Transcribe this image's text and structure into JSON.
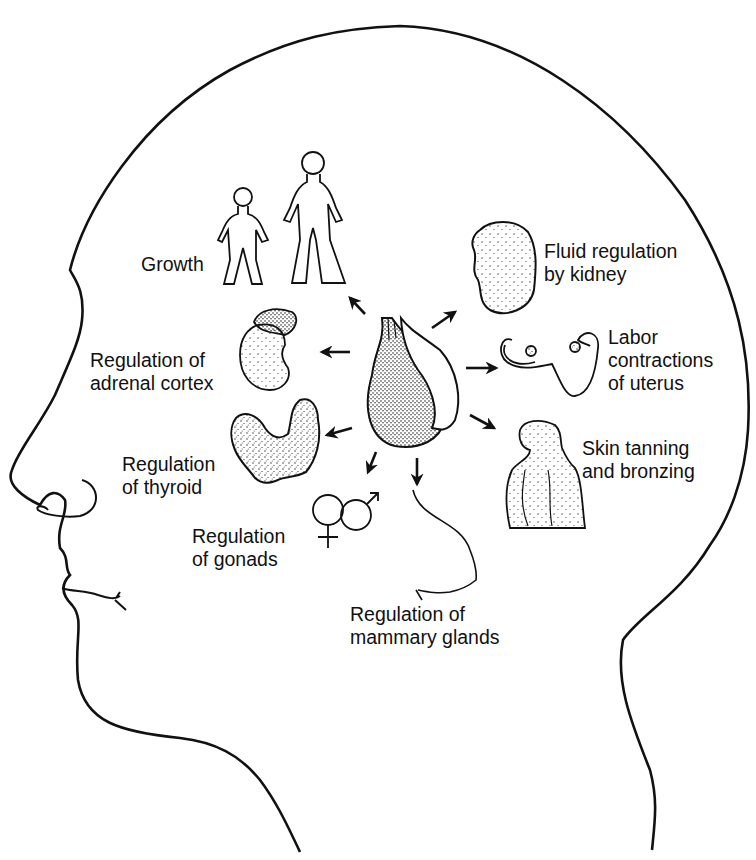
{
  "diagram": {
    "center": "pituitary-gland",
    "colors": {
      "ink": "#111111",
      "background": "#ffffff"
    },
    "labels": [
      {
        "id": "growth",
        "lines": [
          "Growth"
        ]
      },
      {
        "id": "fluid",
        "lines": [
          "Fluid regulation",
          "by kidney"
        ]
      },
      {
        "id": "adrenal",
        "lines": [
          "Regulation of",
          "adrenal cortex"
        ]
      },
      {
        "id": "labor",
        "lines": [
          "Labor",
          "contractions",
          "of uterus"
        ]
      },
      {
        "id": "thyroid",
        "lines": [
          "Regulation",
          "of thyroid"
        ]
      },
      {
        "id": "skin",
        "lines": [
          "Skin tanning",
          "and bronzing"
        ]
      },
      {
        "id": "gonads",
        "lines": [
          "Regulation",
          "of gonads"
        ]
      },
      {
        "id": "mammary",
        "lines": [
          "Regulation of",
          "mammary glands"
        ]
      }
    ],
    "symbols": {
      "female": "♀",
      "male": "♂"
    }
  }
}
